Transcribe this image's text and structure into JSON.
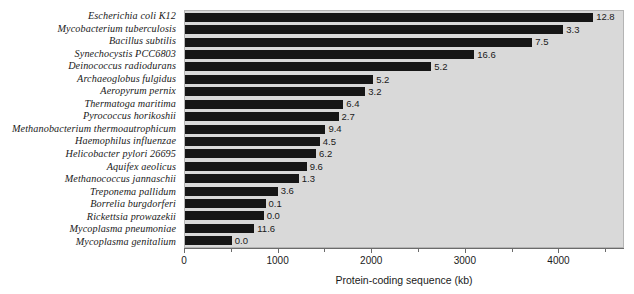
{
  "chart_data": {
    "type": "bar",
    "orientation": "horizontal",
    "title": "",
    "xlabel": "Protein-coding sequence (kb)",
    "ylabel": "",
    "xlim": [
      0,
      4700
    ],
    "xticks": [
      0,
      1000,
      2000,
      3000,
      4000
    ],
    "xtick_labels": [
      "0",
      "1000",
      "2000",
      "3000",
      "4000"
    ],
    "minor_tick_interval": 500,
    "grid": false,
    "legend": false,
    "bar_color": "#161616",
    "plot_background": "#d9d9d9",
    "categories": [
      "Escherichia coli K12",
      "Mycobacterium tuberculosis",
      "Bacillus subtilis",
      "Synechocystis PCC6803",
      "Deinococcus radiodurans",
      "Archaeoglobus fulgidus",
      "Aeropyrum pernix",
      "Thermatoga maritima",
      "Pyrococcus horikoshii",
      "Methanobacterium thermoautrophicum",
      "Haemophilus influenzae",
      "Helicobacter pylori 26695",
      "Aquifex aeolicus",
      "Methanococcus jannaschii",
      "Treponema pallidum",
      "Borrelia burgdorferi",
      "Rickettsia prowazekii",
      "Mycoplasma pneumoniae",
      "Mycoplasma genitalium"
    ],
    "values": [
      4360,
      4040,
      3710,
      3090,
      2630,
      2010,
      1925,
      1690,
      1640,
      1500,
      1440,
      1400,
      1300,
      1215,
      990,
      860,
      840,
      740,
      500
    ],
    "data_labels": [
      "12.8",
      "3.3",
      "7.5",
      "16.6",
      "5.2",
      "5.2",
      "3.2",
      "6.4",
      "2.7",
      "9.4",
      "4.5",
      "6.2",
      "9.6",
      "1.3",
      "3.6",
      "0.1",
      "0.0",
      "11.6",
      "0.0"
    ]
  },
  "axis": {
    "x_title": "Protein-coding sequence (kb)"
  }
}
